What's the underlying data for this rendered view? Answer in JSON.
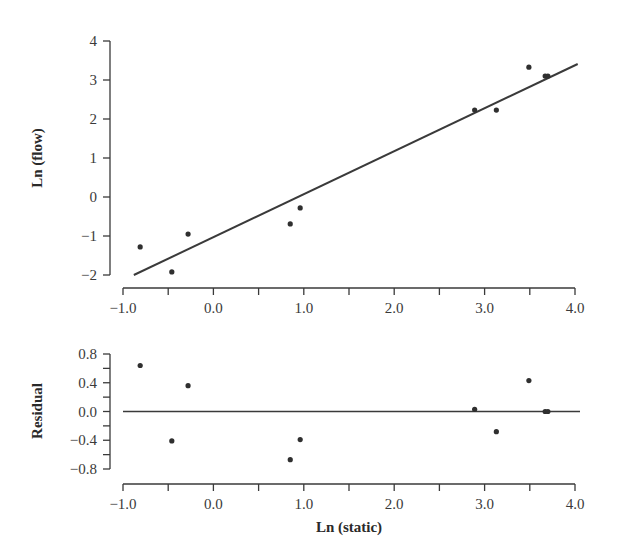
{
  "chart_data": [
    {
      "type": "scatter",
      "panel": "top",
      "title": "",
      "xlabel": "",
      "ylabel": "Ln (flow)",
      "xlim": [
        -1.0,
        4.0
      ],
      "ylim": [
        -2,
        4
      ],
      "x_ticks": [
        "-1.0",
        "0.0",
        "1.0",
        "2.0",
        "3.0",
        "4.0"
      ],
      "y_ticks": [
        "4",
        "3",
        "2",
        "1",
        "0",
        "-1",
        "-2"
      ],
      "grid": false,
      "legend": null,
      "points": [
        {
          "x": -0.81,
          "y": -1.28
        },
        {
          "x": -0.46,
          "y": -1.92
        },
        {
          "x": -0.28,
          "y": -0.95
        },
        {
          "x": 0.85,
          "y": -0.69
        },
        {
          "x": 0.96,
          "y": -0.28
        },
        {
          "x": 2.89,
          "y": 2.23
        },
        {
          "x": 3.13,
          "y": 2.23
        },
        {
          "x": 3.49,
          "y": 3.33
        },
        {
          "x": 3.67,
          "y": 3.1
        },
        {
          "x": 3.7,
          "y": 3.1
        }
      ],
      "fit_line": {
        "x0": -0.88,
        "y0": -2.0,
        "x1": 4.03,
        "y1": 3.41
      }
    },
    {
      "type": "scatter",
      "panel": "bottom",
      "title": "",
      "xlabel": "Ln (static)",
      "ylabel": "Residual",
      "xlim": [
        -1.0,
        4.0
      ],
      "ylim": [
        -0.8,
        0.8
      ],
      "x_ticks": [
        "-1.0",
        "0.0",
        "1.0",
        "2.0",
        "3.0",
        "4.0"
      ],
      "y_ticks": [
        "0.8",
        "0.4",
        "0.0",
        "-0.4",
        "-0.8"
      ],
      "grid": false,
      "legend": null,
      "points": [
        {
          "x": -0.81,
          "y": 0.64
        },
        {
          "x": -0.46,
          "y": -0.41
        },
        {
          "x": -0.28,
          "y": 0.36
        },
        {
          "x": 0.85,
          "y": -0.67
        },
        {
          "x": 0.96,
          "y": -0.39
        },
        {
          "x": 2.89,
          "y": 0.03
        },
        {
          "x": 3.13,
          "y": -0.28
        },
        {
          "x": 3.49,
          "y": 0.43
        },
        {
          "x": 3.67,
          "y": 0.0
        },
        {
          "x": 3.7,
          "y": 0.0
        }
      ],
      "reference_line_y": 0.0
    }
  ],
  "labels": {
    "top_ylabel": "Ln (flow)",
    "bottom_ylabel": "Residual",
    "bottom_xlabel": "Ln (static)",
    "top_xticks": [
      "−1.0",
      "0.0",
      "1.0",
      "2.0",
      "3.0",
      "4.0"
    ],
    "top_yticks": [
      "4",
      "3",
      "2",
      "1",
      "0",
      "−1",
      "−2"
    ],
    "bottom_xticks": [
      "−1.0",
      "0.0",
      "1.0",
      "2.0",
      "3.0",
      "4.0"
    ],
    "bottom_yticks": [
      "0.8",
      "0.4",
      "0.0",
      "−0.4",
      "−0.8"
    ]
  }
}
